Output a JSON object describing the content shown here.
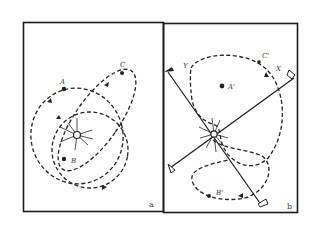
{
  "figure": {
    "panels": [
      {
        "id": "a",
        "label": "a",
        "points": [
          {
            "name": "A",
            "label": "A"
          },
          {
            "name": "B",
            "label": "B"
          },
          {
            "name": "C",
            "label": "C"
          }
        ],
        "center": "sun-star"
      },
      {
        "id": "b",
        "label": "b",
        "points": [
          {
            "name": "A'",
            "label": "A'"
          },
          {
            "name": "B'",
            "label": "B'"
          },
          {
            "name": "C'",
            "label": "C'"
          }
        ],
        "axes": [
          {
            "name": "X",
            "label": "X"
          },
          {
            "name": "Y",
            "label": "Y"
          }
        ],
        "center": "sun-star"
      }
    ],
    "colors": {
      "ink": "#1a1a1a",
      "background": "#ffffff"
    }
  }
}
